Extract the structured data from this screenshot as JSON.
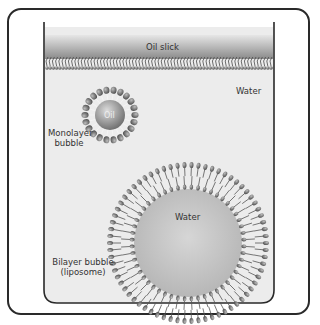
{
  "diagram": {
    "labels": {
      "oil_slick": "Oil slick",
      "water_outside": "Water",
      "oil_core": "Oil",
      "monolayer_line1": "Monolayer",
      "monolayer_line2": "bubble",
      "water_inside": "Water",
      "bilayer_line1": "Bilayer bubble",
      "bilayer_line2": "(liposome)"
    },
    "colors": {
      "frame": "#2a2a2a",
      "container_fill": "#ebebeb",
      "oil_slick_top": "#d8d8d8",
      "oil_slick_bottom": "#8a8a8a",
      "head": "#6f6f6f",
      "tail": "#555555",
      "core": "#b0b0b0"
    }
  }
}
